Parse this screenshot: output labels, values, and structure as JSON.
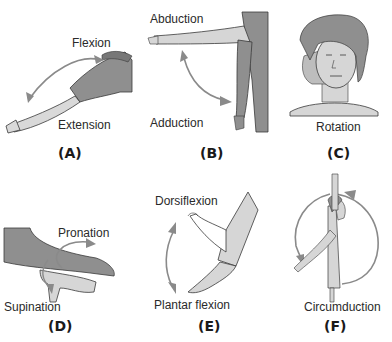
{
  "figure": {
    "panels": [
      {
        "id": "A",
        "tag": "(A)",
        "labels": [
          "Flexion",
          "Extension"
        ],
        "movement": "elbow flexion/extension"
      },
      {
        "id": "B",
        "tag": "(B)",
        "labels": [
          "Abduction",
          "Adduction"
        ],
        "movement": "shoulder abduction/adduction"
      },
      {
        "id": "C",
        "tag": "(C)",
        "labels": [
          "Rotation"
        ],
        "movement": "head rotation"
      },
      {
        "id": "D",
        "tag": "(D)",
        "labels": [
          "Pronation",
          "Supination"
        ],
        "movement": "forearm pronation/supination"
      },
      {
        "id": "E",
        "tag": "(E)",
        "labels": [
          "Dorsiflexion",
          "Plantar flexion"
        ],
        "movement": "ankle dorsiflexion/plantar flexion"
      },
      {
        "id": "F",
        "tag": "(F)",
        "labels": [
          "Circumduction"
        ],
        "movement": "arm circumduction"
      }
    ]
  },
  "colors": {
    "skin_light": "#d6d6d6",
    "skin_dark": "#8f8f8f",
    "arrow": "#8a8a8a",
    "outline": "#3a3a3a",
    "text": "#2a2a2a"
  }
}
